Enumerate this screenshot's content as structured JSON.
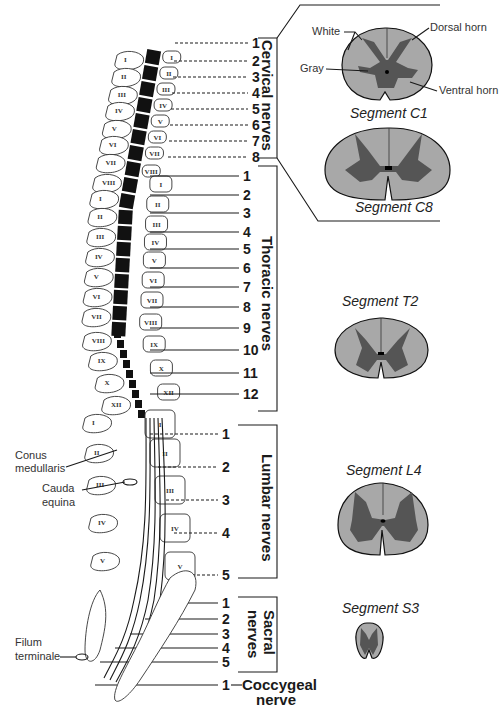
{
  "groups": {
    "cervical": {
      "label": "Cervical nerves",
      "numbers": [
        "1",
        "2",
        "3",
        "4",
        "5",
        "6",
        "7",
        "8"
      ]
    },
    "thoracic": {
      "label": "Thoracic nerves",
      "numbers": [
        "1",
        "2",
        "3",
        "4",
        "5",
        "6",
        "7",
        "8",
        "9",
        "10",
        "11",
        "12"
      ]
    },
    "lumbar": {
      "label": "Lumbar nerves",
      "numbers": [
        "1",
        "2",
        "3",
        "4",
        "5"
      ]
    },
    "sacral": {
      "label_line1": "Sacral",
      "label_line2": "nerves",
      "numbers": [
        "1",
        "2",
        "3",
        "4",
        "5"
      ]
    },
    "coccygeal": {
      "number": "1",
      "label_line1": "Coccygeal",
      "label_line2": "nerve"
    }
  },
  "vertebrae": {
    "cervical": [
      "I",
      "II",
      "III",
      "IV",
      "V",
      "VI",
      "VII",
      "VIII"
    ],
    "thoracic": [
      "I",
      "II",
      "III",
      "IV",
      "V",
      "VI",
      "VII",
      "VIII",
      "IX",
      "X",
      "XII"
    ],
    "lumbar": [
      "I",
      "II",
      "III",
      "IV",
      "V"
    ],
    "left_cervical": [
      "I",
      "II",
      "III",
      "IV",
      "V",
      "VI",
      "VII",
      "VIII"
    ],
    "left_thoracic": [
      "I",
      "II",
      "III",
      "IV",
      "V",
      "VI",
      "VII",
      "VIII",
      "IX",
      "X",
      "XII"
    ],
    "left_lumbar": [
      "I",
      "II",
      "III",
      "IV",
      "V"
    ]
  },
  "annotations": {
    "conus": [
      "Conus",
      "medullaris"
    ],
    "cauda": [
      "Cauda",
      "equina"
    ],
    "filum": [
      "Filum",
      "terminale"
    ]
  },
  "segments": {
    "c1": {
      "title": "Segment C1",
      "labels": {
        "white": "White",
        "gray": "Gray",
        "dorsal": "Dorsal horn",
        "ventral": "Ventral horn"
      }
    },
    "c8": {
      "title": "Segment C8"
    },
    "t2": {
      "title": "Segment T2"
    },
    "l4": {
      "title": "Segment L4"
    },
    "s3": {
      "title": "Segment S3"
    }
  },
  "colors": {
    "white_matter": "#a8a8a8",
    "gray_matter": "#555555",
    "cord": "#111111"
  }
}
